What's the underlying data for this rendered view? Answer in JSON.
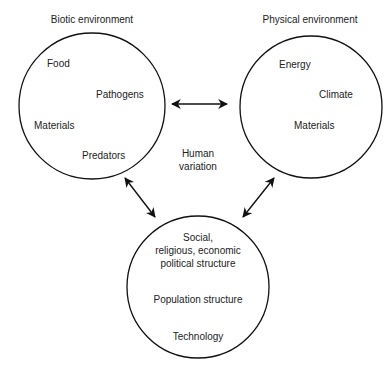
{
  "diagram": {
    "center_label": {
      "line1": "Human",
      "line2": "variation"
    },
    "nodes": [
      {
        "id": "biotic",
        "title": "Biotic environment",
        "items": [
          "Food",
          "Pathogens",
          "Materials",
          "Predators"
        ]
      },
      {
        "id": "physical",
        "title": "Physical environment",
        "items": [
          "Energy",
          "Climate",
          "Materials"
        ]
      },
      {
        "id": "social",
        "title": "",
        "items": [
          "Social,",
          "religious, economic",
          "political structure",
          "Population structure",
          "Technology"
        ]
      }
    ],
    "edges": [
      {
        "from": "biotic",
        "to": "physical",
        "type": "bidirectional"
      },
      {
        "from": "biotic",
        "to": "social",
        "type": "bidirectional"
      },
      {
        "from": "physical",
        "to": "social",
        "type": "bidirectional"
      }
    ],
    "colors": {
      "stroke": "#111111",
      "text": "#222222",
      "background": "#ffffff"
    }
  }
}
